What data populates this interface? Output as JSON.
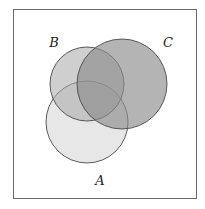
{
  "diagram": {
    "type": "venn",
    "frame": {
      "x": 13,
      "y": 9,
      "width": 183,
      "height": 189,
      "stroke": "#6a6a6a"
    },
    "sets": [
      {
        "id": "A",
        "label": "A",
        "cx": 87,
        "cy": 122,
        "r": 41,
        "fill": "#e3e3e3",
        "opacity": 0.85,
        "label_x": 100,
        "label_y": 185
      },
      {
        "id": "B",
        "label": "B",
        "cx": 87,
        "cy": 84,
        "r": 37,
        "fill": "#a8a8a8",
        "opacity": 0.55,
        "label_x": 54,
        "label_y": 47
      },
      {
        "id": "C",
        "label": "C",
        "cx": 122,
        "cy": 84,
        "r": 45,
        "fill": "#8c8c8c",
        "opacity": 0.65,
        "label_x": 168,
        "label_y": 47
      }
    ],
    "stroke": "#4a4a4a"
  }
}
